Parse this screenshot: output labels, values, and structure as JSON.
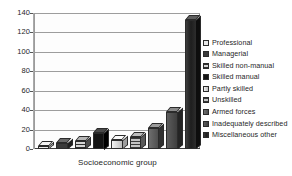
{
  "chart_data": {
    "type": "bar",
    "title": "",
    "subtitle": "",
    "xlabel": "Socioeconomic group",
    "ylabel": "",
    "ylim": [
      0,
      140
    ],
    "ytick_step": 20,
    "ytick_labels": [
      "140",
      "120",
      "100",
      "80",
      "60",
      "40",
      "20",
      "0"
    ],
    "grid": true,
    "grid_orientation": "horizontal",
    "style": "3d-grayscale",
    "legend_position": "right",
    "categories": [
      "Professional",
      "Managerial",
      "Skilled non-manual",
      "Skilled manual",
      "Partly skilled",
      "Unskilled",
      "Armed forces",
      "Inadequately described",
      "Miscellaneous other"
    ],
    "values": [
      3,
      6,
      8,
      17,
      9,
      12,
      22,
      38,
      133
    ],
    "series": [
      {
        "name": "Socioeconomic group",
        "values": [
          3,
          6,
          8,
          17,
          9,
          12,
          22,
          38,
          133
        ]
      }
    ],
    "bar_fills": [
      "light",
      "dark",
      "hatch",
      "black",
      "lightgrad",
      "midhatch",
      "mid",
      "mid2",
      "verydark"
    ]
  },
  "legend": {
    "items": [
      {
        "label": "Professional",
        "fill": "light"
      },
      {
        "label": "Managerial",
        "fill": "dark"
      },
      {
        "label": "Skilled non-manual",
        "fill": "hatch"
      },
      {
        "label": "Skilled manual",
        "fill": "black"
      },
      {
        "label": "Partly skilled",
        "fill": "lightgrad"
      },
      {
        "label": "Unskilled",
        "fill": "midhatch"
      },
      {
        "label": "Armed forces",
        "fill": "mid"
      },
      {
        "label": "Inadequately described",
        "fill": "mid2"
      },
      {
        "label": "Miscellaneous other",
        "fill": "verydark"
      }
    ]
  },
  "colors": {
    "background": "#ffffff",
    "gridline": "#9d9d9d",
    "axis": "#3d3d3d",
    "text": "#1f1f1f"
  }
}
